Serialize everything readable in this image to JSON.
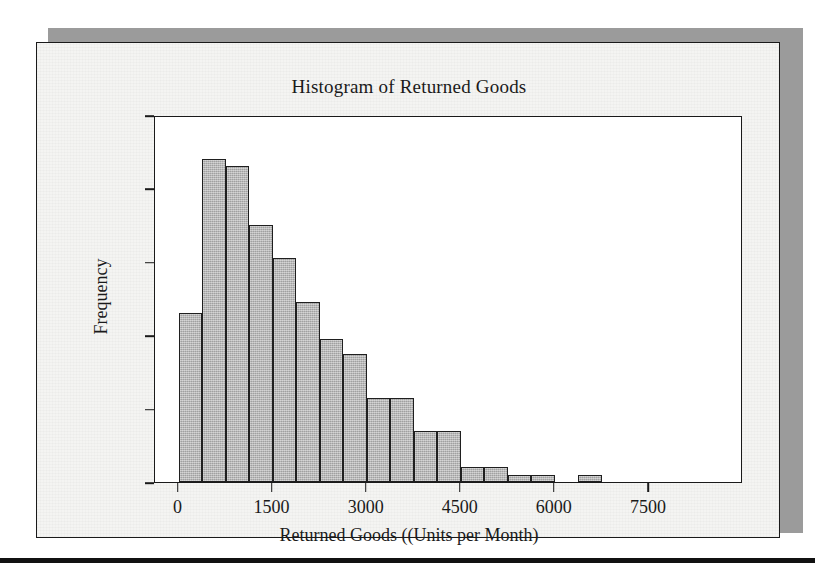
{
  "figure": {
    "title": "Histogram of Returned Goods"
  },
  "chart_data": {
    "type": "bar",
    "title": "Histogram of Returned Goods",
    "xlabel": "Returned Goods ((Units per Month)",
    "ylabel": "Frequency",
    "xlim": [
      -375,
      9000
    ],
    "ylim": [
      0,
      50
    ],
    "grid": false,
    "legend": null,
    "bin_width": 375,
    "x_ticks": [
      0,
      1500,
      3000,
      4500,
      6000,
      7500
    ],
    "x_tick_labels": [
      "0",
      "1500",
      "3000",
      "4500",
      "6000",
      "7500"
    ],
    "y_ticks": [
      0,
      10,
      20,
      30,
      40,
      50
    ],
    "y_tick_labels": [
      "0",
      "10",
      "20",
      "30",
      "40",
      "50"
    ],
    "bins": [
      {
        "left": 0,
        "right": 375,
        "value": 23
      },
      {
        "left": 375,
        "right": 750,
        "value": 44
      },
      {
        "left": 750,
        "right": 1125,
        "value": 43
      },
      {
        "left": 1125,
        "right": 1500,
        "value": 35
      },
      {
        "left": 1500,
        "right": 1875,
        "value": 30.5
      },
      {
        "left": 1875,
        "right": 2250,
        "value": 24.5
      },
      {
        "left": 2250,
        "right": 2625,
        "value": 19.5
      },
      {
        "left": 2625,
        "right": 3000,
        "value": 17.5
      },
      {
        "left": 3000,
        "right": 3375,
        "value": 11.5
      },
      {
        "left": 3375,
        "right": 3750,
        "value": 11.5
      },
      {
        "left": 3750,
        "right": 4125,
        "value": 7
      },
      {
        "left": 4125,
        "right": 4500,
        "value": 7
      },
      {
        "left": 4500,
        "right": 4875,
        "value": 2
      },
      {
        "left": 4875,
        "right": 5250,
        "value": 2
      },
      {
        "left": 5250,
        "right": 5625,
        "value": 1
      },
      {
        "left": 5625,
        "right": 6000,
        "value": 1
      },
      {
        "left": 6000,
        "right": 6375,
        "value": 0
      },
      {
        "left": 6375,
        "right": 6750,
        "value": 1
      }
    ],
    "bar_fill_color": "#b0b0b0",
    "bar_edge_color": "#1f1f1f"
  },
  "colors": {
    "bar_fill": "#b0b0b0",
    "bar_edge": "#1f1f1f",
    "axis": "#1a1a1a",
    "card_background": "#f4f4f2",
    "plot_background": "#ffffff",
    "shadow": "#9b9b9b"
  }
}
